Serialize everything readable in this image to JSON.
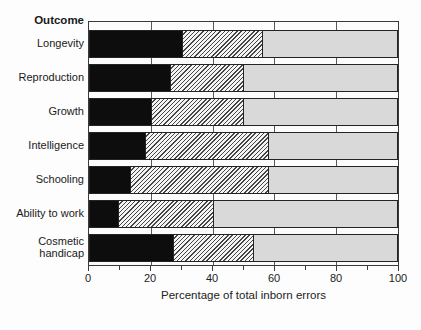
{
  "figure": {
    "outcome_header": "Outcome"
  },
  "chart_data": {
    "type": "bar",
    "orientation": "horizontal-stacked",
    "title": "",
    "ylabel": "Outcome",
    "xlabel": "Percentage of total inborn errors",
    "categories": [
      "Longevity",
      "Reproduction",
      "Growth",
      "Intelligence",
      "Schooling",
      "Ability to work",
      "Cosmetic handicap"
    ],
    "series": [
      {
        "name": "solid-black-segment",
        "fill": "solid-black",
        "values": [
          30,
          26,
          20,
          18,
          13,
          9,
          27
        ]
      },
      {
        "name": "diagonal-hatch-segment",
        "fill": "diagonal-hatch",
        "values": [
          26,
          24,
          30,
          40,
          45,
          31,
          26
        ]
      },
      {
        "name": "light-gray-segment",
        "fill": "light-gray",
        "values": [
          44,
          50,
          50,
          42,
          42,
          60,
          47
        ]
      }
    ],
    "xlim": [
      0,
      100
    ],
    "x_ticks": [
      0,
      20,
      40,
      60,
      80,
      100
    ],
    "x_minor_ticks": [
      10,
      30,
      50,
      70,
      90
    ],
    "gridlines_at": [
      20,
      40,
      60,
      80
    ],
    "legend": "none",
    "colors": {
      "black_fill": "#0d0d0d",
      "hatch_line": "#454545",
      "hatch_background": "#f4f4f4",
      "gray_fill": "#d9d9d9",
      "frame": "#3a3a3a",
      "background": "#fdfdfd"
    }
  }
}
